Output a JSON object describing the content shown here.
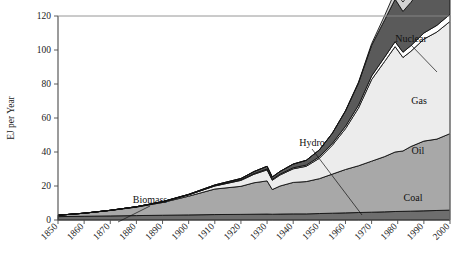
{
  "chart_data": {
    "type": "area",
    "title": "",
    "subtitle": "",
    "xlabel": "",
    "ylabel": "EJ per Year",
    "xlim": [
      1850,
      2000
    ],
    "ylim": [
      0,
      120
    ],
    "grid": false,
    "legend_position": "inline-annotations",
    "stacked": true,
    "x_ticks": [
      "1850",
      "1860",
      "1870",
      "1880",
      "1890",
      "1900",
      "1910",
      "1920",
      "1930",
      "1940",
      "1950",
      "1960",
      "1970",
      "1980",
      "1990",
      "2000"
    ],
    "y_ticks": [
      "0",
      "20",
      "40",
      "60",
      "80",
      "100",
      "120"
    ],
    "x": [
      1850,
      1860,
      1870,
      1880,
      1890,
      1900,
      1910,
      1920,
      1925,
      1930,
      1932,
      1935,
      1940,
      1945,
      1950,
      1955,
      1960,
      1965,
      1970,
      1975,
      1979,
      1982,
      1985,
      1990,
      1995,
      2000
    ],
    "series": [
      {
        "name": "Biomass",
        "color": "#6e6e6e",
        "values": [
          2.0,
          2.2,
          2.4,
          2.6,
          2.8,
          3.0,
          3.2,
          3.3,
          3.4,
          3.5,
          3.4,
          3.5,
          3.6,
          3.6,
          3.8,
          4.0,
          4.2,
          4.4,
          4.6,
          4.8,
          5.0,
          5.1,
          5.2,
          5.4,
          5.6,
          5.8
        ]
      },
      {
        "name": "Coal",
        "color": "#a8a8a8",
        "values": [
          0.8,
          1.8,
          3.2,
          5.0,
          7.5,
          11.0,
          15.0,
          16.5,
          18.5,
          19.5,
          14.5,
          16.5,
          18.5,
          19.0,
          20.5,
          23.0,
          25.5,
          27.5,
          30.0,
          32.5,
          35.0,
          35.5,
          38.0,
          41.0,
          42.0,
          45.0
        ]
      },
      {
        "name": "Oil",
        "color": "#ececec",
        "values": [
          0.0,
          0.0,
          0.1,
          0.2,
          0.4,
          0.8,
          1.8,
          3.5,
          5.0,
          6.5,
          5.5,
          6.5,
          8.0,
          9.0,
          12.0,
          17.0,
          24.0,
          34.0,
          48.0,
          56.0,
          62.0,
          55.0,
          56.0,
          60.0,
          63.0,
          66.0
        ]
      },
      {
        "name": "Hydro",
        "color": "#ffffff",
        "values": [
          0.0,
          0.0,
          0.0,
          0.0,
          0.0,
          0.1,
          0.2,
          0.3,
          0.4,
          0.5,
          0.5,
          0.5,
          0.6,
          0.7,
          0.9,
          1.1,
          1.4,
          1.7,
          2.1,
          2.5,
          2.9,
          3.1,
          3.3,
          3.6,
          3.9,
          4.2
        ]
      },
      {
        "name": "Gas",
        "color": "#5a5a5a",
        "values": [
          0.0,
          0.0,
          0.0,
          0.0,
          0.1,
          0.2,
          0.4,
          0.8,
          1.2,
          1.6,
          1.4,
          1.6,
          2.2,
          2.8,
          4.0,
          6.0,
          9.0,
          13.0,
          18.0,
          22.0,
          25.0,
          24.0,
          25.5,
          28.0,
          30.0,
          33.0
        ]
      },
      {
        "name": "Nuclear",
        "color": "#d4d4d4",
        "values": [
          0.0,
          0.0,
          0.0,
          0.0,
          0.0,
          0.0,
          0.0,
          0.0,
          0.0,
          0.0,
          0.0,
          0.0,
          0.0,
          0.0,
          0.0,
          0.0,
          0.2,
          0.5,
          1.0,
          2.5,
          4.5,
          5.5,
          6.5,
          7.5,
          8.0,
          8.5
        ]
      }
    ],
    "annotations": [
      {
        "label": "Biomass",
        "x": 150,
        "y": 203,
        "leader_to_x": 118,
        "leader_to_y": 222
      },
      {
        "label": "Hydro",
        "x": 312,
        "y": 146,
        "leader_to_x": 362,
        "leader_to_y": 215
      },
      {
        "label": "Coal",
        "x": 413,
        "y": 201,
        "leader_to_x": null,
        "leader_to_y": null
      },
      {
        "label": "Oil",
        "x": 418,
        "y": 154,
        "leader_to_x": null,
        "leader_to_y": null
      },
      {
        "label": "Gas",
        "x": 419,
        "y": 104,
        "leader_to_x": null,
        "leader_to_y": null
      },
      {
        "label": "Nuclear",
        "x": 411,
        "y": 42,
        "leader_to_x": 437,
        "leader_to_y": 72
      }
    ]
  }
}
